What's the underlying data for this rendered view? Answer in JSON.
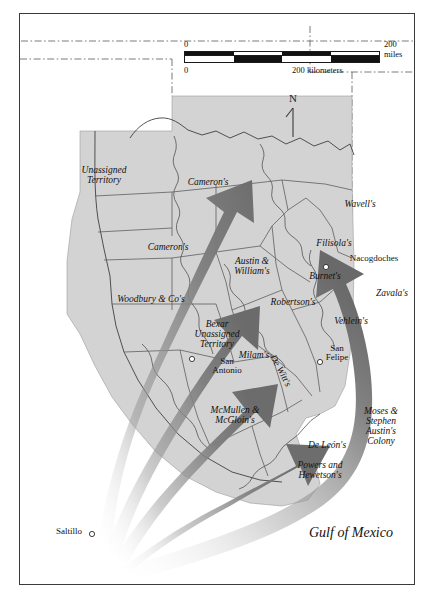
{
  "map": {
    "title_region": "Texas Empresario Grants",
    "frame_color": "#3a3a3a",
    "land_color": "#d4d4d4",
    "water_color": "#ffffff",
    "arrow_color": "#7b7b7b",
    "arrow_dark_color": "#6e6e6e",
    "boundary_color": "#5a5a5a"
  },
  "scale": {
    "miles": {
      "zero": "0",
      "max": "200 miles"
    },
    "kilometers": {
      "zero": "0",
      "max": "200 kilometers"
    }
  },
  "compass": {
    "north_label": "N"
  },
  "water_labels": [
    {
      "name": "gulf-of-mexico",
      "text": "Gulf of Mexico"
    }
  ],
  "grants": [
    {
      "id": "unassigned-territory",
      "text": "Unassigned\nTerritory"
    },
    {
      "id": "cameron-north",
      "text": "Cameron's"
    },
    {
      "id": "cameron-west",
      "text": "Cameron's"
    },
    {
      "id": "wavell",
      "text": "Wavell's"
    },
    {
      "id": "filisola",
      "text": "Filisola's"
    },
    {
      "id": "austin-and-william",
      "text": "Austin &\nWilliam's"
    },
    {
      "id": "burnet",
      "text": "Burnet's"
    },
    {
      "id": "zavala",
      "text": "Zavala's"
    },
    {
      "id": "woodbury-and-co",
      "text": "Woodbury & Co's"
    },
    {
      "id": "robertson",
      "text": "Robertson's"
    },
    {
      "id": "vehlein",
      "text": "Vehlein's"
    },
    {
      "id": "bexar-unassigned",
      "text": "Bexar\nUnassigned\nTerritory"
    },
    {
      "id": "milam",
      "text": "Milam's"
    },
    {
      "id": "de-witt",
      "text": "De Witt's"
    },
    {
      "id": "mcmullen-and-mcgloin",
      "text": "McMullen &\nMcGloin's"
    },
    {
      "id": "de-leon",
      "text": "De León's"
    },
    {
      "id": "moses-stephen-austin",
      "text": "Moses &\nStephen\nAustin's\nColony"
    },
    {
      "id": "powers-and-hewetson",
      "text": "Powers and\nHewetson's"
    }
  ],
  "cities": [
    {
      "id": "nacogdoches",
      "text": "Nacogdoches"
    },
    {
      "id": "san-antonio",
      "text": "San\nAntonio"
    },
    {
      "id": "san-felipe",
      "text": "San\nFelipe"
    },
    {
      "id": "saltillo",
      "text": "Saltillo"
    }
  ]
}
